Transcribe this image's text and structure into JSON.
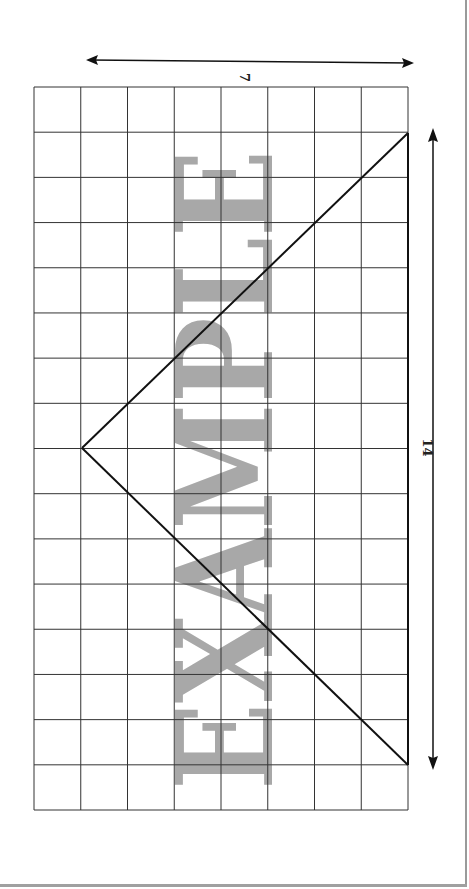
{
  "diagram": {
    "type": "grid-triangle",
    "grid": {
      "columns": 8,
      "rows": 16
    },
    "triangle": {
      "apex": {
        "col": 1,
        "row": 8
      },
      "base_start": {
        "col": 8,
        "row": 1
      },
      "base_end": {
        "col": 8,
        "row": 15
      }
    },
    "dimensions": {
      "height_label": "7",
      "base_label": "14"
    },
    "watermark": {
      "text": "EXAMPLE",
      "color": "#a8a8a8"
    },
    "colors": {
      "grid_line": "#333333",
      "triangle_line": "#111111",
      "arrow": "#111111"
    }
  }
}
